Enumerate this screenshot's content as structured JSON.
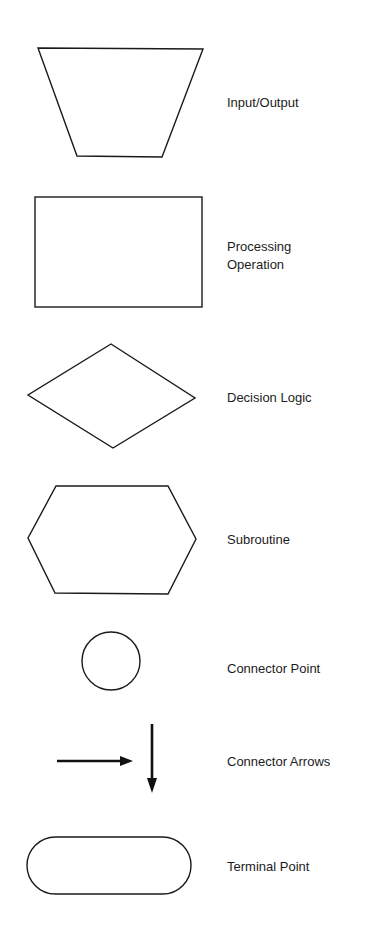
{
  "diagram": {
    "type": "flowchart-symbol-legend",
    "symbols": [
      {
        "id": "input-output",
        "shape": "trapezoid",
        "label_lines": [
          "Input/Output"
        ]
      },
      {
        "id": "processing-operation",
        "shape": "rectangle",
        "label_lines": [
          "Processing",
          "Operation"
        ]
      },
      {
        "id": "decision-logic",
        "shape": "diamond",
        "label_lines": [
          "Decision Logic"
        ]
      },
      {
        "id": "subroutine",
        "shape": "hexagon",
        "label_lines": [
          "Subroutine"
        ]
      },
      {
        "id": "connector-point",
        "shape": "circle",
        "label_lines": [
          "Connector Point"
        ]
      },
      {
        "id": "connector-arrows",
        "shape": "arrows",
        "label_lines": [
          "Connector Arrows"
        ]
      },
      {
        "id": "terminal-point",
        "shape": "rounded-rectangle",
        "label_lines": [
          "Terminal Point"
        ]
      }
    ],
    "colors": {
      "stroke": "#1a1a1a",
      "background": "#ffffff",
      "text": "#1c1c1c"
    }
  }
}
